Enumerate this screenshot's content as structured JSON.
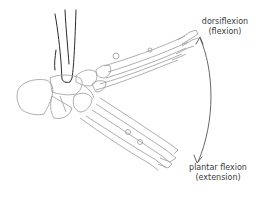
{
  "diagram": {
    "labels": {
      "dorsiflexion": {
        "line1": "dorsiflexion",
        "line2": "(flexion)"
      },
      "plantar_flexion": {
        "line1": "plantar flexion",
        "line2": "(extension)"
      }
    },
    "colors": {
      "bone_outline": "#9a9a9a",
      "tibia_outline": "#2a2a2a",
      "arrow": "#555555",
      "text": "#3a3a3a",
      "background": "#ffffff"
    }
  }
}
